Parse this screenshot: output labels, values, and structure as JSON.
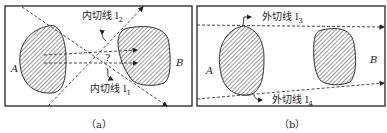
{
  "panels": [
    {
      "id": "a",
      "caption": "（a）",
      "shape_left_label": "A",
      "shape_right_label": "B",
      "line_top_label": "内切线 l",
      "line_top_sub": "2",
      "line_bottom_label": "内切线 l",
      "line_bottom_sub": "1",
      "center_mark": "?"
    },
    {
      "id": "b",
      "caption": "（b）",
      "shape_left_label": "A",
      "shape_right_label": "B",
      "line_top_label": "外切线 l",
      "line_top_sub": "3",
      "line_bottom_label": "外切线 l",
      "line_bottom_sub": "4"
    }
  ],
  "colors": {
    "stroke": "#333333",
    "hatch": "#444444",
    "frame": "#222222"
  }
}
